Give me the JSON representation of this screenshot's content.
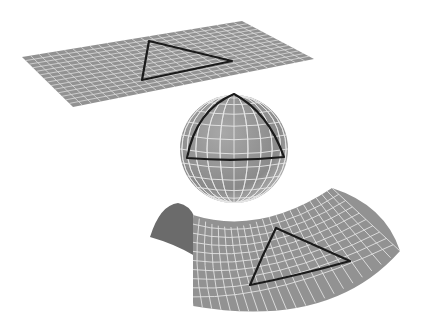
{
  "diagram": {
    "description": "Triangles on surfaces of zero, positive and negative curvature",
    "colors": {
      "background": "#ffffff",
      "surface": "#929292",
      "surface_dark": "#6b6b6b",
      "grid": "#dcdcdc",
      "triangle": "#1a1a1a"
    },
    "shapes": [
      {
        "name": "flat-plane",
        "curvature": "zero",
        "corners": [
          [
            22,
            57
          ],
          [
            242,
            21
          ],
          [
            314,
            59
          ],
          [
            73,
            107
          ]
        ],
        "grid": {
          "u": 26,
          "v": 14
        },
        "triangle": [
          [
            149,
            41
          ],
          [
            232,
            61
          ],
          [
            142,
            80
          ]
        ]
      },
      {
        "name": "sphere",
        "curvature": "positive",
        "center": [
          234,
          149
        ],
        "radius": 54,
        "triangle": [
          [
            234,
            94
          ],
          [
            284,
            157
          ],
          [
            187,
            158
          ]
        ]
      },
      {
        "name": "saddle",
        "curvature": "negative",
        "triangle": [
          [
            276,
            228
          ],
          [
            350,
            261
          ],
          [
            250,
            285
          ]
        ]
      }
    ]
  }
}
